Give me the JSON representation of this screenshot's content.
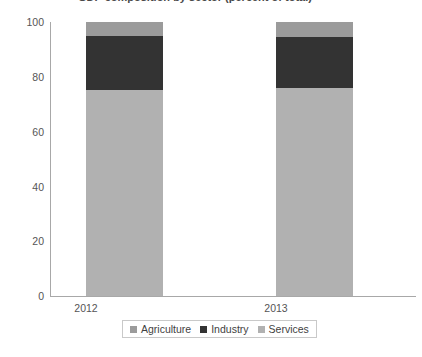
{
  "chart_data": {
    "type": "bar",
    "subtype": "stacked-column-100",
    "title": "GDP composition by sector (percent of total)",
    "title_clipped": true,
    "xlabel": "",
    "ylabel": "",
    "categories": [
      "2012",
      "2013"
    ],
    "ylim": [
      0,
      100
    ],
    "yticks": [
      0,
      20,
      40,
      60,
      80,
      100
    ],
    "ytick_labels": [
      "0",
      "20",
      "40",
      "60",
      "80",
      "100"
    ],
    "grid": false,
    "legend_position": "bottom",
    "series": [
      {
        "name": "Agriculture",
        "color": "#9b9b9b",
        "values": [
          5.1,
          5.5
        ]
      },
      {
        "name": "Industry",
        "color": "#333333",
        "values": [
          19.7,
          18.6
        ]
      },
      {
        "name": "Services",
        "color": "#b1b1b1",
        "values": [
          75.2,
          75.9
        ]
      }
    ]
  },
  "axis": {
    "line_color": "#a8a8a8"
  }
}
